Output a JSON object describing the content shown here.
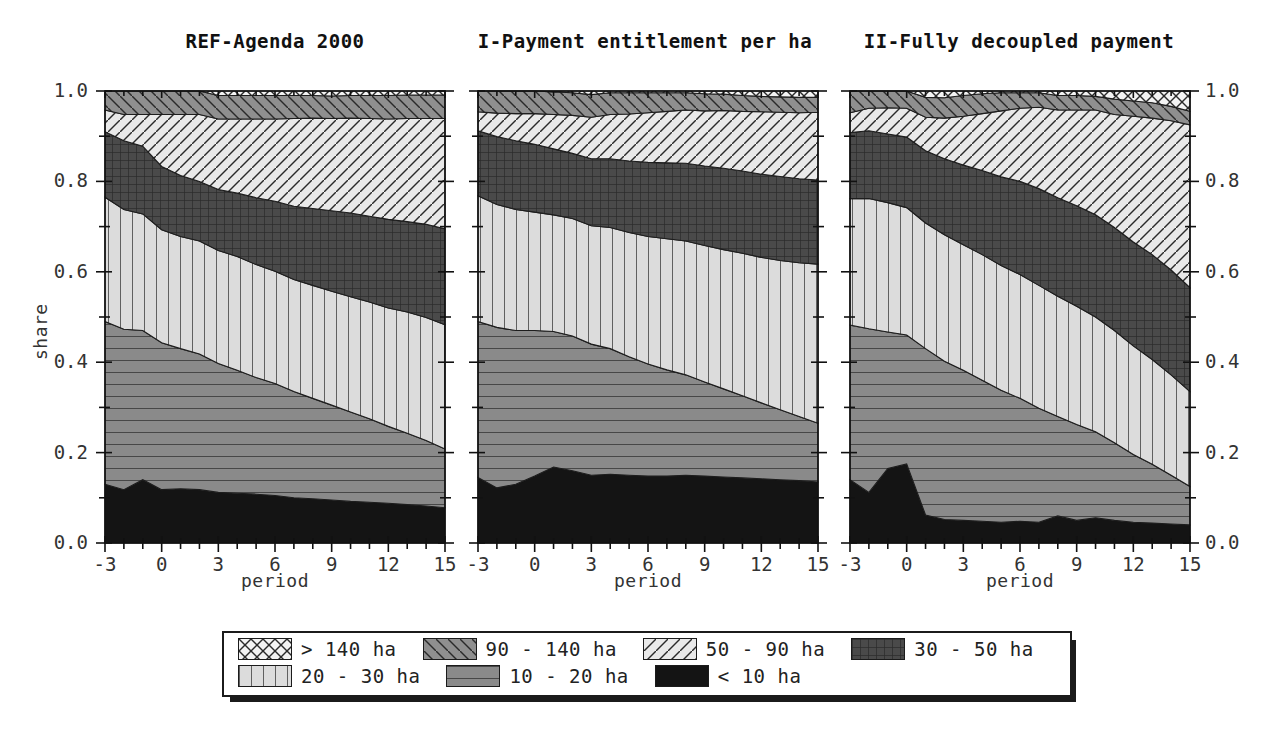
{
  "figure": {
    "ylabel": "share",
    "xlabel": "period",
    "y_ticks": [
      "0.0",
      "0.2",
      "0.4",
      "0.6",
      "0.8",
      "1.0"
    ],
    "x_ticks": [
      "-3",
      "0",
      "3",
      "6",
      "9",
      "12",
      "15"
    ]
  },
  "legend": {
    "rows": [
      [
        {
          "label": "> 140 ha",
          "pattern": "crosshatch-diag",
          "color": "#f2f2f2"
        },
        {
          "label": "90 - 140 ha",
          "pattern": "diagonal-back",
          "color": "#8c8c8c"
        },
        {
          "label": "50 - 90 ha",
          "pattern": "diagonal-fwd",
          "color": "#e6e6e6"
        },
        {
          "label": "30 - 50 ha",
          "pattern": "grid-fine",
          "color": "#4d4d4d"
        }
      ],
      [
        {
          "label": "20 - 30 ha",
          "pattern": "vertical",
          "color": "#dcdcdc"
        },
        {
          "label": "10 - 20 ha",
          "pattern": "horizontal",
          "color": "#8a8a8a"
        },
        {
          "label": "< 10 ha",
          "pattern": "solid-dark",
          "color": "#111111"
        }
      ]
    ]
  },
  "chart_data": {
    "type": "area",
    "xlabel": "period",
    "ylabel": "share",
    "xlim": [
      -3,
      15
    ],
    "ylim": [
      0,
      1
    ],
    "grid": false,
    "legend_position": "bottom",
    "stack_order_bottom_to_top": [
      "< 10 ha",
      "10 - 20 ha",
      "20 - 30 ha",
      "30 - 50 ha",
      "50 - 90 ha",
      "90 - 140 ha",
      "> 140 ha"
    ],
    "x": [
      -3,
      -2,
      -1,
      0,
      1,
      2,
      3,
      4,
      5,
      6,
      7,
      8,
      9,
      10,
      11,
      12,
      13,
      14,
      15
    ],
    "panels": [
      {
        "title": "REF-Agenda 2000",
        "series": [
          {
            "name": "< 10 ha",
            "values": [
              0.13,
              0.118,
              0.14,
              0.118,
              0.12,
              0.118,
              0.112,
              0.11,
              0.108,
              0.105,
              0.1,
              0.098,
              0.095,
              0.092,
              0.09,
              0.088,
              0.085,
              0.082,
              0.078
            ]
          },
          {
            "name": "10 - 20 ha",
            "values": [
              0.36,
              0.355,
              0.33,
              0.325,
              0.31,
              0.3,
              0.285,
              0.272,
              0.258,
              0.248,
              0.235,
              0.222,
              0.21,
              0.198,
              0.185,
              0.17,
              0.158,
              0.145,
              0.13
            ]
          },
          {
            "name": "20 - 30 ha",
            "values": [
              0.275,
              0.265,
              0.258,
              0.25,
              0.248,
              0.25,
              0.25,
              0.252,
              0.25,
              0.248,
              0.248,
              0.25,
              0.252,
              0.255,
              0.258,
              0.262,
              0.268,
              0.272,
              0.275
            ]
          },
          {
            "name": "30 - 50 ha",
            "values": [
              0.145,
              0.152,
              0.15,
              0.14,
              0.135,
              0.132,
              0.135,
              0.14,
              0.148,
              0.155,
              0.162,
              0.17,
              0.178,
              0.185,
              0.19,
              0.196,
              0.2,
              0.206,
              0.212
            ]
          },
          {
            "name": "50 - 90 ha",
            "values": [
              0.048,
              0.058,
              0.07,
              0.115,
              0.135,
              0.148,
              0.156,
              0.164,
              0.174,
              0.182,
              0.194,
              0.2,
              0.204,
              0.21,
              0.216,
              0.222,
              0.228,
              0.234,
              0.244
            ]
          },
          {
            "name": "90 - 140 ha",
            "values": [
              0.042,
              0.052,
              0.052,
              0.052,
              0.052,
              0.052,
              0.052,
              0.052,
              0.052,
              0.052,
              0.051,
              0.05,
              0.05,
              0.05,
              0.051,
              0.052,
              0.052,
              0.052,
              0.052
            ]
          },
          {
            "name": "> 140 ha",
            "values": [
              0.0,
              0.0,
              0.0,
              0.0,
              0.0,
              0.0,
              0.01,
              0.01,
              0.01,
              0.01,
              0.01,
              0.01,
              0.011,
              0.008,
              0.01,
              0.01,
              0.009,
              0.009,
              0.009
            ]
          }
        ]
      },
      {
        "title": "I-Payment entitlement per ha",
        "series": [
          {
            "name": "< 10 ha",
            "values": [
              0.145,
              0.122,
              0.13,
              0.148,
              0.168,
              0.16,
              0.15,
              0.152,
              0.15,
              0.148,
              0.148,
              0.15,
              0.148,
              0.146,
              0.144,
              0.142,
              0.14,
              0.138,
              0.135
            ]
          },
          {
            "name": "10 - 20 ha",
            "values": [
              0.345,
              0.355,
              0.34,
              0.322,
              0.3,
              0.298,
              0.29,
              0.278,
              0.262,
              0.248,
              0.235,
              0.222,
              0.208,
              0.195,
              0.182,
              0.168,
              0.155,
              0.142,
              0.13
            ]
          },
          {
            "name": "20 - 30 ha",
            "values": [
              0.278,
              0.272,
              0.268,
              0.262,
              0.258,
              0.26,
              0.262,
              0.268,
              0.275,
              0.282,
              0.29,
              0.296,
              0.302,
              0.308,
              0.315,
              0.322,
              0.33,
              0.34,
              0.352
            ]
          },
          {
            "name": "30 - 50 ha",
            "values": [
              0.144,
              0.15,
              0.152,
              0.15,
              0.146,
              0.144,
              0.148,
              0.152,
              0.158,
              0.164,
              0.168,
              0.172,
              0.176,
              0.18,
              0.182,
              0.184,
              0.186,
              0.186,
              0.186
            ]
          },
          {
            "name": "50 - 90 ha",
            "values": [
              0.042,
              0.052,
              0.06,
              0.068,
              0.076,
              0.084,
              0.092,
              0.098,
              0.104,
              0.11,
              0.114,
              0.118,
              0.122,
              0.128,
              0.132,
              0.138,
              0.142,
              0.146,
              0.15
            ]
          },
          {
            "name": "90 - 140 ha",
            "values": [
              0.046,
              0.049,
              0.05,
              0.05,
              0.05,
              0.05,
              0.05,
              0.048,
              0.047,
              0.044,
              0.041,
              0.038,
              0.038,
              0.036,
              0.035,
              0.034,
              0.034,
              0.034,
              0.033
            ]
          },
          {
            "name": "> 140 ha",
            "values": [
              0.0,
              0.0,
              0.0,
              0.0,
              0.002,
              0.004,
              0.008,
              0.004,
              0.004,
              0.004,
              0.004,
              0.004,
              0.006,
              0.007,
              0.01,
              0.012,
              0.013,
              0.014,
              0.014
            ]
          }
        ]
      },
      {
        "title": "II-Fully decoupled payment",
        "series": [
          {
            "name": "< 10 ha",
            "values": [
              0.14,
              0.112,
              0.165,
              0.175,
              0.062,
              0.052,
              0.05,
              0.048,
              0.046,
              0.048,
              0.046,
              0.06,
              0.05,
              0.056,
              0.05,
              0.046,
              0.044,
              0.042,
              0.04
            ]
          },
          {
            "name": "10 - 20 ha",
            "values": [
              0.342,
              0.362,
              0.302,
              0.285,
              0.368,
              0.35,
              0.332,
              0.312,
              0.292,
              0.272,
              0.252,
              0.22,
              0.212,
              0.19,
              0.172,
              0.15,
              0.13,
              0.108,
              0.085
            ]
          },
          {
            "name": "20 - 30 ha",
            "values": [
              0.28,
              0.288,
              0.286,
              0.282,
              0.278,
              0.28,
              0.278,
              0.278,
              0.276,
              0.274,
              0.272,
              0.266,
              0.262,
              0.254,
              0.248,
              0.24,
              0.232,
              0.222,
              0.21
            ]
          },
          {
            "name": "30 - 50 ha",
            "values": [
              0.146,
              0.15,
              0.152,
              0.156,
              0.16,
              0.168,
              0.176,
              0.186,
              0.196,
              0.206,
              0.214,
              0.218,
              0.222,
              0.226,
              0.228,
              0.23,
              0.232,
              0.232,
              0.23
            ]
          },
          {
            "name": "50 - 90 ha",
            "values": [
              0.044,
              0.05,
              0.058,
              0.064,
              0.074,
              0.09,
              0.108,
              0.126,
              0.146,
              0.162,
              0.18,
              0.194,
              0.212,
              0.232,
              0.25,
              0.278,
              0.302,
              0.33,
              0.36
            ]
          },
          {
            "name": "90 - 140 ha",
            "values": [
              0.048,
              0.038,
              0.037,
              0.038,
              0.044,
              0.045,
              0.046,
              0.044,
              0.04,
              0.034,
              0.032,
              0.032,
              0.032,
              0.03,
              0.034,
              0.034,
              0.034,
              0.032,
              0.03
            ]
          },
          {
            "name": "> 140 ha",
            "values": [
              0.0,
              0.0,
              0.0,
              0.0,
              0.014,
              0.015,
              0.01,
              0.006,
              0.004,
              0.004,
              0.004,
              0.01,
              0.01,
              0.012,
              0.018,
              0.022,
              0.026,
              0.034,
              0.045
            ]
          }
        ]
      }
    ]
  }
}
